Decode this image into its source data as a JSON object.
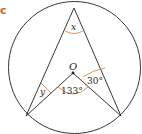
{
  "part_label": "c",
  "labels": {
    "center": "O",
    "angle_top": "x",
    "angle_left": "y",
    "angle_center": "133°",
    "angle_right": "30°"
  },
  "colors": {
    "stroke": "#231f20",
    "arc": "#d9893f",
    "part_label": "#c8682a"
  }
}
